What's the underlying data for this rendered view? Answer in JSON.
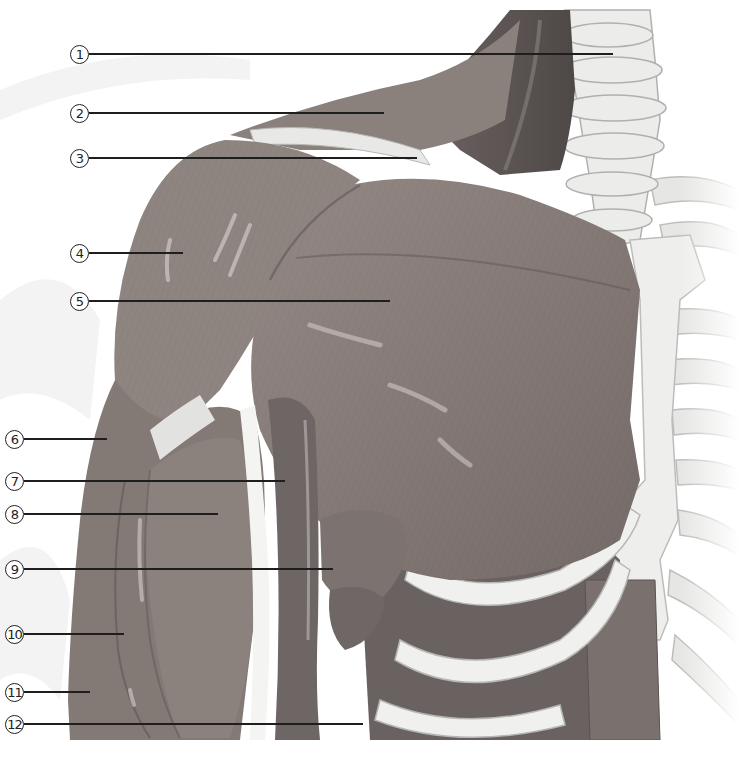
{
  "figure": {
    "palette": {
      "background": "#ffffff",
      "muscle": "#857a76",
      "muscle_dark": "#5e5654",
      "muscle_light": "#a79d99",
      "bone": "#ececea",
      "bone_shadow": "#c8c8c6",
      "leader_line": "#1e1e1e"
    }
  },
  "labels": [
    {
      "id": "1",
      "text": "1",
      "x": 70,
      "y": 43,
      "line_end": 613
    },
    {
      "id": "2",
      "text": "2",
      "x": 70,
      "y": 102,
      "line_end": 384
    },
    {
      "id": "3",
      "text": "3",
      "x": 70,
      "y": 147,
      "line_end": 417
    },
    {
      "id": "4",
      "text": "4",
      "x": 70,
      "y": 242,
      "line_end": 183
    },
    {
      "id": "5",
      "text": "5",
      "x": 70,
      "y": 290,
      "line_end": 390
    },
    {
      "id": "6",
      "text": "6",
      "x": 5,
      "y": 428,
      "line_end": 107
    },
    {
      "id": "7",
      "text": "7",
      "x": 5,
      "y": 470,
      "line_end": 285
    },
    {
      "id": "8",
      "text": "8",
      "x": 5,
      "y": 503,
      "line_end": 218
    },
    {
      "id": "9",
      "text": "9",
      "x": 5,
      "y": 558,
      "line_end": 333
    },
    {
      "id": "10",
      "text": "10",
      "x": 5,
      "y": 623,
      "line_end": 124
    },
    {
      "id": "11",
      "text": "11",
      "x": 5,
      "y": 681,
      "line_end": 90
    },
    {
      "id": "12",
      "text": "12",
      "x": 5,
      "y": 713,
      "line_end": 363
    }
  ]
}
